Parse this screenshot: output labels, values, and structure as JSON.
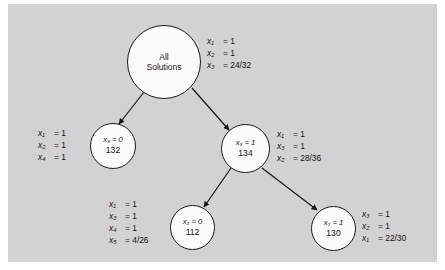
{
  "figure": {
    "type": "tree-diagram",
    "background_color": "#d2d2d2",
    "node_fill": "#fbfbfb",
    "node_stroke": "#1a1a1a"
  },
  "nodes": {
    "root": {
      "title_line1": "All",
      "title_line2": "Solutions",
      "label": [
        {
          "lhs": "x₁",
          "rhs": "= 1"
        },
        {
          "lhs": "x₂",
          "rhs": "= 1"
        },
        {
          "lhs": "x₃",
          "rhs": "= 24/32"
        }
      ]
    },
    "left": {
      "title": "x₃ = 0",
      "count": "132",
      "label": [
        {
          "lhs": "x₁",
          "rhs": "= 1"
        },
        {
          "lhs": "x₂",
          "rhs": "= 1"
        },
        {
          "lhs": "x₄",
          "rhs": "= 1"
        }
      ]
    },
    "right": {
      "title": "x₃ = 1",
      "count": "134",
      "label": [
        {
          "lhs": "x₁",
          "rhs": "= 1"
        },
        {
          "lhs": "x₃",
          "rhs": "= 1"
        },
        {
          "lhs": "x₂",
          "rhs": "= 28/36"
        }
      ]
    },
    "bottom_left": {
      "title": "x₂ = 0",
      "count": "112",
      "label": [
        {
          "lhs": "x₁",
          "rhs": "= 1"
        },
        {
          "lhs": "x₃",
          "rhs": "= 1"
        },
        {
          "lhs": "x₄",
          "rhs": "= 1"
        },
        {
          "lhs": "x₅",
          "rhs": "= 4/26"
        }
      ]
    },
    "bottom_right": {
      "title": "x₂ = 1",
      "count": "130",
      "label": [
        {
          "lhs": "x₃",
          "rhs": "= 1"
        },
        {
          "lhs": "x₂",
          "rhs": "= 1"
        },
        {
          "lhs": "x₁",
          "rhs": "= 22/30"
        }
      ]
    }
  },
  "edges": [
    {
      "from": "root",
      "to": "left"
    },
    {
      "from": "root",
      "to": "right"
    },
    {
      "from": "right",
      "to": "bottom_left"
    },
    {
      "from": "right",
      "to": "bottom_right"
    }
  ]
}
